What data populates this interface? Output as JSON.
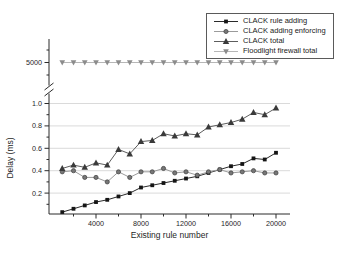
{
  "chart_data": {
    "type": "line",
    "title": "",
    "xlabel": "Existing rule number",
    "ylabel": "Delay (ms)",
    "broken_y_axis": true,
    "grid": "horizontal",
    "legend_position": "top-right",
    "x": [
      1000,
      2000,
      3000,
      4000,
      5000,
      6000,
      7000,
      8000,
      9000,
      10000,
      11000,
      12000,
      13000,
      14000,
      15000,
      16000,
      17000,
      18000,
      19000,
      20000
    ],
    "axis": {
      "x_ticks_major_values": [
        4000,
        8000,
        12000,
        16000,
        20000
      ],
      "x_ticks_major_labels": [
        "4000",
        "8000",
        "12000",
        "16000",
        "20000"
      ],
      "x_ticks_minor_values": [
        2000,
        6000,
        10000,
        14000,
        18000
      ],
      "y_lower_tick_values": [
        0.2,
        0.4,
        0.6,
        0.8,
        1.0
      ],
      "y_lower_tick_labels": [
        "0.2",
        "0.4",
        "0.6",
        "0.8",
        "1.0"
      ],
      "y_lower_minor_values": [
        0.1,
        0.3,
        0.5,
        0.7,
        0.9
      ],
      "y_lower_range": [
        0,
        1.08
      ],
      "y_upper_tick_value": 5000,
      "y_upper_tick_label": "5000"
    },
    "series": [
      {
        "name": "CLACK rule adding",
        "marker": "square",
        "color": "#151515",
        "line_color": "#2a2a2a",
        "y_axis": "lower",
        "values": [
          0.03,
          0.06,
          0.09,
          0.12,
          0.14,
          0.17,
          0.2,
          0.25,
          0.27,
          0.29,
          0.31,
          0.33,
          0.35,
          0.38,
          0.41,
          0.44,
          0.46,
          0.51,
          0.5,
          0.56
        ]
      },
      {
        "name": "CLACK adding enforcing",
        "marker": "circle",
        "color": "#777777",
        "line_color": "#9b9b9b",
        "y_axis": "lower",
        "values": [
          0.39,
          0.4,
          0.34,
          0.34,
          0.3,
          0.39,
          0.34,
          0.39,
          0.39,
          0.42,
          0.38,
          0.39,
          0.36,
          0.39,
          0.41,
          0.38,
          0.39,
          0.4,
          0.38,
          0.38
        ]
      },
      {
        "name": "CLACK total",
        "marker": "triangle-up",
        "color": "#3a3a3a",
        "line_color": "#5d5d5d",
        "y_axis": "lower",
        "values": [
          0.42,
          0.45,
          0.43,
          0.47,
          0.45,
          0.59,
          0.55,
          0.66,
          0.67,
          0.73,
          0.71,
          0.73,
          0.72,
          0.79,
          0.81,
          0.83,
          0.86,
          0.92,
          0.9,
          0.96
        ]
      },
      {
        "name": "Floodlight firewall total",
        "marker": "triangle-down",
        "color": "#8c8c8c",
        "line_color": "#b7b7b7",
        "y_axis": "upper",
        "values": [
          5000,
          5000,
          5000,
          5000,
          5000,
          5000,
          5000,
          5000,
          5000,
          5000,
          5000,
          5000,
          5000,
          5000,
          5000,
          5000,
          5000,
          5000,
          5000,
          5000
        ]
      }
    ]
  }
}
